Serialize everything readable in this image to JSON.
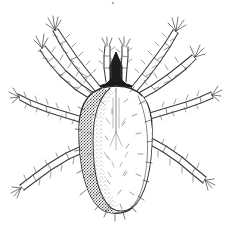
{
  "figure": {
    "kind": "scientific-line-illustration",
    "technique": "pen-and-ink stipple",
    "caption": "",
    "title_text": "",
    "background_color": "#ffffff",
    "ink_color": "#3a3a3a",
    "shade_color": "#2a2a2a",
    "canvas": {
      "width": 231,
      "height": 242
    }
  },
  "anatomy": {
    "idiosoma": {
      "label": "",
      "outline_color": "#2e2e2e",
      "fill_color": "#ffffff",
      "shaded_side": "left",
      "shade_density": "dense-stipple"
    },
    "gnathosoma": {
      "label": "",
      "color": "#1d1d1d",
      "shape": "arrow"
    },
    "palps": {
      "label": "",
      "count": 2
    },
    "legs": {
      "label": "",
      "count": 8,
      "segments_per_leg": 6,
      "setae": "bristled"
    }
  },
  "legend": {
    "items": []
  },
  "annotations": []
}
